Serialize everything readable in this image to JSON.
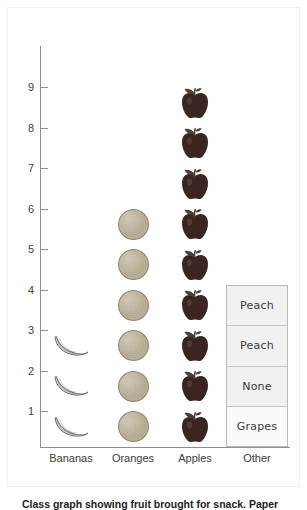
{
  "caption": "Class graph showing fruit brought for snack. Paper",
  "chart_data": {
    "type": "bar",
    "subtype": "pictograph",
    "title": "",
    "xlabel": "",
    "ylabel": "",
    "ylim": [
      0,
      9
    ],
    "grid": false,
    "legend": "none",
    "categories": [
      "Bananas",
      "Oranges",
      "Apples",
      "Other"
    ],
    "values": [
      3,
      6,
      9,
      4
    ],
    "y_ticks": [
      "1",
      "2",
      "3",
      "4",
      "5",
      "6",
      "7",
      "8",
      "9"
    ],
    "icons": [
      "banana-icon",
      "orange-icon",
      "apple-icon",
      "label-box"
    ],
    "other_column_labels": [
      "Grapes",
      "None",
      "Peach",
      "Peach"
    ],
    "annotations": []
  },
  "colors": {
    "axis": "#8e8e8e",
    "tick_text": "#444444",
    "apple": "#3a2520",
    "apple_leaf": "#4a4038",
    "orange": "#b9b098",
    "orange_outline": "#8d846e",
    "banana": "#d9d2c2",
    "banana_outline": "#6f6f6f",
    "box_border": "#b9b9b9",
    "box_shade": "#f1f1f1",
    "caption_text": "#1d1d1d"
  }
}
